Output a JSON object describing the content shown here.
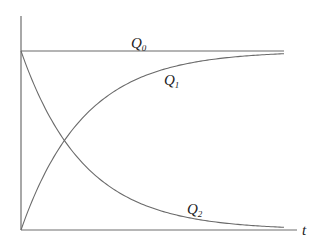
{
  "chart_data": {
    "type": "line",
    "title": "",
    "xlabel": "t",
    "ylabel": "",
    "grid": false,
    "legend": "inline labels on curves",
    "x_range": [
      0,
      10
    ],
    "y_range": [
      0,
      1
    ],
    "x": [
      0,
      0.5,
      1,
      1.5,
      2,
      3,
      4,
      5,
      6,
      7,
      8,
      9,
      10
    ],
    "series": [
      {
        "name": "Q0",
        "label_main": "Q",
        "label_sub": "0",
        "shape": "constant",
        "values": [
          1,
          1,
          1,
          1,
          1,
          1,
          1,
          1,
          1,
          1,
          1,
          1,
          1
        ]
      },
      {
        "name": "Q1",
        "label_main": "Q",
        "label_sub": "1",
        "shape": "rising saturating",
        "values": [
          0,
          0.23,
          0.4,
          0.53,
          0.63,
          0.77,
          0.86,
          0.91,
          0.94,
          0.96,
          0.97,
          0.98,
          0.985
        ]
      },
      {
        "name": "Q2",
        "label_main": "Q",
        "label_sub": "2",
        "shape": "exponential decay",
        "values": [
          1,
          0.77,
          0.6,
          0.47,
          0.37,
          0.23,
          0.14,
          0.09,
          0.06,
          0.04,
          0.03,
          0.02,
          0.015
        ]
      }
    ],
    "annotations": [
      "Q1 and Q2 intersect near t≈1.1, value≈0.42"
    ]
  },
  "labels": {
    "q0_main": "Q",
    "q0_sub": "0",
    "q1_main": "Q",
    "q1_sub": "1",
    "q2_main": "Q",
    "q2_sub": "2",
    "x_axis": "t"
  }
}
